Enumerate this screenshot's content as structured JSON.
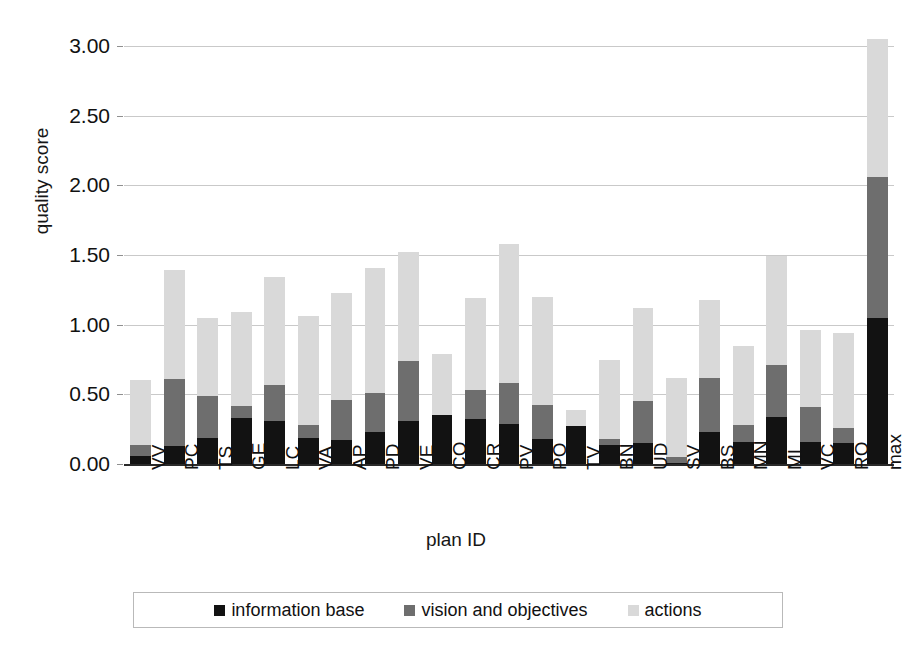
{
  "chart_data": {
    "type": "bar",
    "subtype": "stacked",
    "title": "",
    "xlabel": "plan ID",
    "ylabel": "quality score",
    "ylim": [
      0,
      3.0
    ],
    "yticks": [
      "0.00",
      "0.50",
      "1.00",
      "1.50",
      "2.00",
      "2.50",
      "3.00"
    ],
    "ytick_values": [
      0,
      0.5,
      1.0,
      1.5,
      2.0,
      2.5,
      3.0
    ],
    "grid": true,
    "legend_position": "bottom",
    "categories": [
      "VV",
      "PC",
      "TS",
      "GE",
      "LC",
      "VA",
      "AP",
      "PD",
      "VE",
      "CO",
      "CR",
      "PV",
      "PO",
      "TV",
      "BN",
      "UD",
      "SV",
      "BS",
      "MN",
      "MI",
      "VC",
      "RO",
      "max"
    ],
    "series": [
      {
        "name": "information base",
        "color": "#121212",
        "values": [
          0.06,
          0.13,
          0.19,
          0.33,
          0.31,
          0.19,
          0.17,
          0.23,
          0.31,
          0.35,
          0.32,
          0.29,
          0.18,
          0.27,
          0.14,
          0.15,
          0.01,
          0.23,
          0.16,
          0.34,
          0.16,
          0.15,
          1.05
        ]
      },
      {
        "name": "vision and objectives",
        "color": "#6e6e6e",
        "values": [
          0.08,
          0.48,
          0.3,
          0.09,
          0.26,
          0.09,
          0.29,
          0.28,
          0.43,
          0.0,
          0.21,
          0.29,
          0.24,
          0.0,
          0.04,
          0.3,
          0.04,
          0.39,
          0.12,
          0.37,
          0.25,
          0.11,
          1.01
        ]
      },
      {
        "name": "actions",
        "color": "#d9d9d9",
        "values": [
          0.46,
          0.78,
          0.56,
          0.67,
          0.77,
          0.78,
          0.77,
          0.9,
          0.78,
          0.44,
          0.66,
          1.0,
          0.78,
          0.12,
          0.57,
          0.67,
          0.57,
          0.56,
          0.57,
          0.78,
          0.55,
          0.68,
          0.99
        ]
      }
    ],
    "totals": [
      0.6,
      1.39,
      1.05,
      1.09,
      1.34,
      1.06,
      1.23,
      1.41,
      1.52,
      0.79,
      1.19,
      1.58,
      1.2,
      0.39,
      0.75,
      1.12,
      0.62,
      1.18,
      0.85,
      1.49,
      0.96,
      0.94,
      3.05
    ]
  },
  "legend": {
    "items": [
      {
        "label": "information base",
        "color": "#121212",
        "icon": "square-swatch-black"
      },
      {
        "label": "vision and objectives",
        "color": "#6e6e6e",
        "icon": "square-swatch-dark-gray"
      },
      {
        "label": "actions",
        "color": "#d9d9d9",
        "icon": "square-swatch-light-gray"
      }
    ]
  }
}
